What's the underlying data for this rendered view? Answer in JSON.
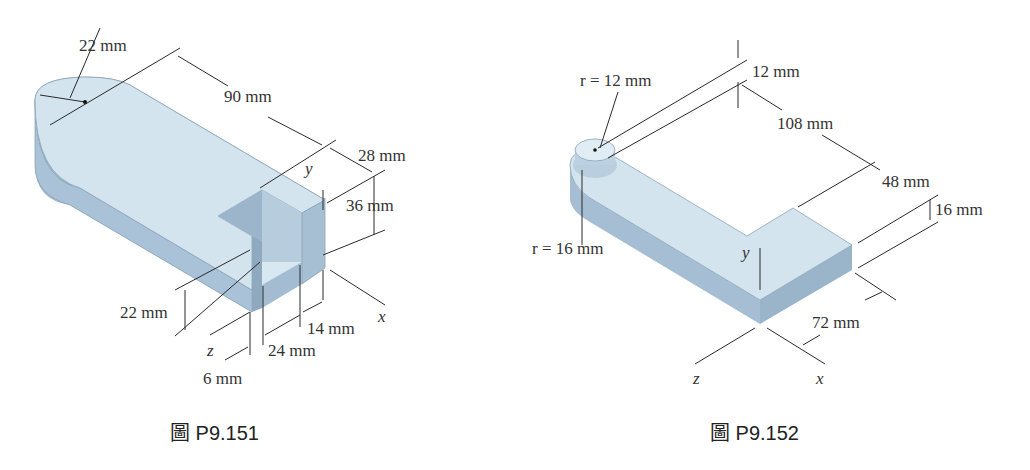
{
  "colors": {
    "solid_top": "#d3e4ef",
    "solid_side": "#9fb9d0",
    "solid_front": "#b6cde0",
    "line": "#2a2a2a",
    "text": "#333333"
  },
  "figures": [
    {
      "caption": "圖 P9.151",
      "dimensions": {
        "radius": "22 mm",
        "length": "90 mm",
        "width": "28 mm",
        "height": "36 mm",
        "slot_bottom": "22 mm",
        "slot_depth": "14 mm",
        "slot_width": "24 mm",
        "wall": "6 mm"
      },
      "axes": {
        "x": "x",
        "y": "y",
        "z": "z"
      }
    },
    {
      "caption": "圖 P9.152",
      "dimensions": {
        "r_top": "r = 12 mm",
        "r_bottom": "r = 16 mm",
        "boss_height": "12 mm",
        "length": "108 mm",
        "width": "48 mm",
        "thickness": "16 mm",
        "foot": "72 mm"
      },
      "axes": {
        "x": "x",
        "y": "y",
        "z": "z"
      }
    }
  ]
}
